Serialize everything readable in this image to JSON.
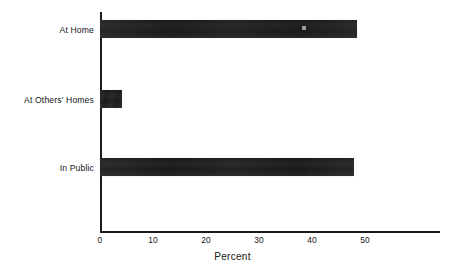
{
  "chart_data": {
    "type": "bar",
    "orientation": "horizontal",
    "title": "",
    "subtitle": "",
    "xlabel": "Percent",
    "ylabel": "",
    "categories": [
      "At Home",
      "At Others' Homes",
      "In Public"
    ],
    "values": [
      48.5,
      4.2,
      48.0
    ],
    "series": [
      {
        "name": "Percent",
        "values": [
          48.5,
          4.2,
          48.0
        ]
      }
    ],
    "xlim": [
      0,
      50
    ],
    "ylim": null,
    "xticks": [
      0,
      10,
      20,
      30,
      40,
      50
    ],
    "xtick_labels": [
      "0",
      "10",
      "20",
      "30",
      "40",
      "50"
    ],
    "yticks": [
      "At Home",
      "At Others' Homes",
      "In Public"
    ],
    "grid": false,
    "legend": false,
    "legend_position": "none",
    "bar_color": "#1a1a1a",
    "background_color": "#ffffff",
    "axis_color": "#1b1b1b",
    "text_color": "#141414",
    "annotations": []
  },
  "axis": {
    "x_title": "Percent",
    "ticks": [
      {
        "label": "0",
        "value": 0
      },
      {
        "label": "10",
        "value": 10
      },
      {
        "label": "20",
        "value": 20
      },
      {
        "label": "30",
        "value": 30
      },
      {
        "label": "40",
        "value": 40
      },
      {
        "label": "50",
        "value": 50
      }
    ]
  },
  "bars": [
    {
      "label": "At Home",
      "value": 48.5
    },
    {
      "label": "At Others' Homes",
      "value": 4.2
    },
    {
      "label": "In Public",
      "value": 48.0
    }
  ]
}
